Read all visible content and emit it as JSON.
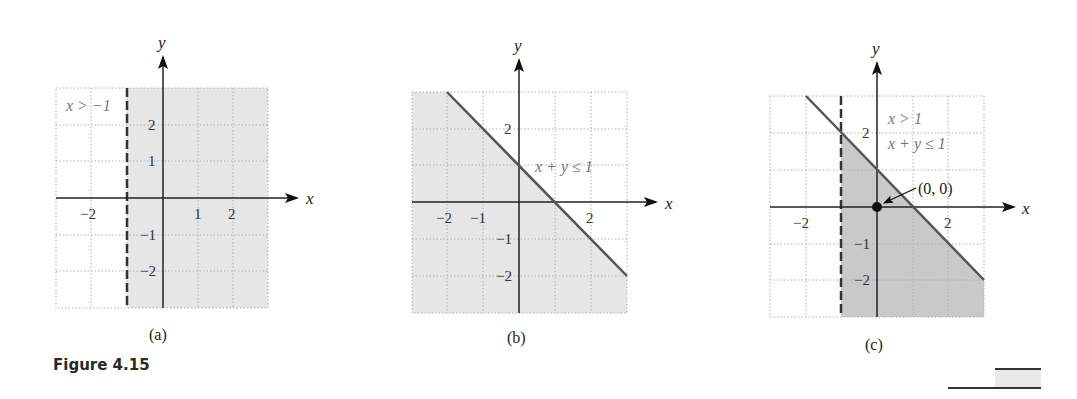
{
  "figure": {
    "title": "Figure 4.15"
  },
  "panels": [
    {
      "caption": "(a)",
      "axis_x_label": "x",
      "axis_y_label": "y",
      "inequality_label": "x > −1",
      "x_ticks": [
        "−2",
        "1",
        "2"
      ],
      "y_ticks": [
        "2",
        "1",
        "−1",
        "−2"
      ]
    },
    {
      "caption": "(b)",
      "axis_x_label": "x",
      "axis_y_label": "y",
      "inequality_label": "x + y ≤ 1",
      "x_ticks": [
        "−2",
        "−1",
        "2"
      ],
      "y_ticks": [
        "2",
        "−1",
        "−2"
      ]
    },
    {
      "caption": "(c)",
      "axis_x_label": "x",
      "axis_y_label": "y",
      "inequality_label_1": "x > 1",
      "inequality_label_2": "x + y ≤ 1",
      "point_label": "(0, 0)",
      "x_ticks": [
        "−2",
        "2"
      ],
      "y_ticks": [
        "2",
        "−1",
        "−2"
      ]
    }
  ],
  "colors": {
    "light_fill": "#e6e6e6",
    "dark_fill": "#c9c9c9",
    "boundary_line": "#555555",
    "grid": "#b0b0b0",
    "axis": "#222222",
    "label_grey": "#777777"
  }
}
